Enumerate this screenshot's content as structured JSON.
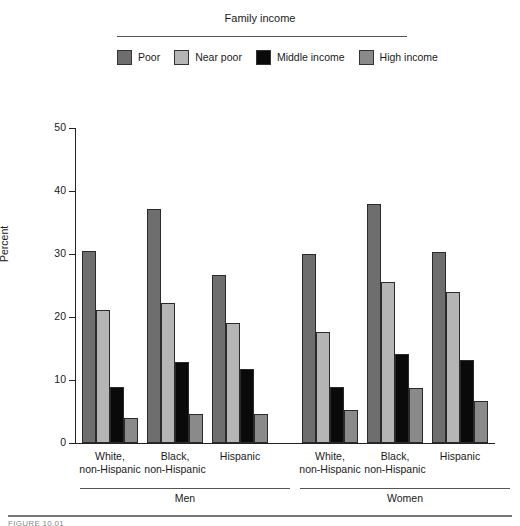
{
  "legend": {
    "title": "Family income",
    "items": [
      {
        "label": "Poor",
        "color": "#6e6e6e"
      },
      {
        "label": "Near poor",
        "color": "#b5b5b5"
      },
      {
        "label": "Middle income",
        "color": "#0a0a0a"
      },
      {
        "label": "High income",
        "color": "#8a8a8a"
      }
    ]
  },
  "axis": {
    "ylabel": "Percent",
    "yticks": [
      "0",
      "10",
      "20",
      "30",
      "40",
      "50"
    ]
  },
  "sex_groups": [
    {
      "label": "Men"
    },
    {
      "label": "Women"
    }
  ],
  "caption": "FIGURE 10.01",
  "chart_data": {
    "type": "bar",
    "title": "",
    "xlabel": "",
    "ylabel": "Percent",
    "ylim": [
      0,
      50
    ],
    "yticks": [
      0,
      10,
      20,
      30,
      40,
      50
    ],
    "grid": false,
    "legend_title": "Family income",
    "legend_position": "top",
    "categories": [
      "Men - White, non-Hispanic",
      "Men - Black, non-Hispanic",
      "Men - Hispanic",
      "Women - White, non-Hispanic",
      "Women - Black, non-Hispanic",
      "Women - Hispanic"
    ],
    "category_labels": [
      {
        "line1": "White,",
        "line2": "non-Hispanic"
      },
      {
        "line1": "Black,",
        "line2": "non-Hispanic"
      },
      {
        "line1": "Hispanic",
        "line2": ""
      },
      {
        "line1": "White,",
        "line2": "non-Hispanic"
      },
      {
        "line1": "Black,",
        "line2": "non-Hispanic"
      },
      {
        "line1": "Hispanic",
        "line2": ""
      }
    ],
    "series": [
      {
        "name": "Poor",
        "color": "#6e6e6e",
        "values": [
          30.5,
          37.1,
          26.7,
          30.0,
          37.9,
          30.3
        ]
      },
      {
        "name": "Near poor",
        "color": "#b5b5b5",
        "values": [
          21.1,
          22.2,
          19.0,
          17.6,
          25.6,
          24.0
        ]
      },
      {
        "name": "Middle income",
        "color": "#0a0a0a",
        "values": [
          8.9,
          12.9,
          11.7,
          8.9,
          14.2,
          13.1
        ]
      },
      {
        "name": "High income",
        "color": "#8a8a8a",
        "values": [
          3.9,
          4.6,
          4.6,
          5.2,
          8.8,
          6.6
        ]
      }
    ]
  }
}
